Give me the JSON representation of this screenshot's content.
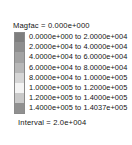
{
  "legend": {
    "header": "Magfac =  0.000e+000",
    "footer": "Interval =  2.0e+004",
    "separator": "to",
    "background_color": "#ffffff",
    "text_color": "#141414",
    "border_color": "#8a8a8a",
    "rows": [
      {
        "from": "0.0000e+000",
        "to": "2.0000e+004",
        "label": "0.0000e+000 to  2.0000e+004",
        "color": "#7e7e7e"
      },
      {
        "from": "2.0000e+004",
        "to": "4.0000e+004",
        "label": "2.0000e+004 to  4.0000e+004",
        "color": "#8e8e8e"
      },
      {
        "from": "4.0000e+004",
        "to": "6.0000e+004",
        "label": "4.0000e+004 to  6.0000e+004",
        "color": "#a3a3a3"
      },
      {
        "from": "6.0000e+004",
        "to": "8.0000e+004",
        "label": "6.0000e+004 to  8.0000e+004",
        "color": "#b8b8b8"
      },
      {
        "from": "8.0000e+004",
        "to": "1.0000e+005",
        "label": "8.0000e+004 to  1.0000e+005",
        "color": "#d6d6d6"
      },
      {
        "from": "1.0000e+005",
        "to": "1.2000e+005",
        "label": "1.0000e+005 to  1.2000e+005",
        "color": "#f4f4f4"
      },
      {
        "from": "1.2000e+005",
        "to": "1.4000e+005",
        "label": "1.2000e+005 to  1.4000e+005",
        "color": "#c9c9c9"
      },
      {
        "from": "1.4000e+005",
        "to": "1.4037e+005",
        "label": "1.4000e+005 to  1.4037e+005",
        "color": "#909090"
      }
    ]
  },
  "chart_data": {
    "type": "table",
    "title": "Magfac =  0.000e+000",
    "annotations": [
      "Interval =  2.0e+004"
    ],
    "legend_position": "left",
    "categories": [
      "0.0000e+000 to 2.0000e+004",
      "2.0000e+004 to 4.0000e+004",
      "4.0000e+004 to 6.0000e+004",
      "6.0000e+004 to 8.0000e+004",
      "8.0000e+004 to 1.0000e+005",
      "1.0000e+005 to 1.2000e+005",
      "1.2000e+005 to 1.4000e+005",
      "1.4000e+005 to 1.4037e+005"
    ],
    "bin_edges": [
      0,
      20000,
      40000,
      60000,
      80000,
      100000,
      120000,
      140000,
      140370
    ],
    "colors": [
      "#7e7e7e",
      "#8e8e8e",
      "#a3a3a3",
      "#b8b8b8",
      "#d6d6d6",
      "#f4f4f4",
      "#c9c9c9",
      "#909090"
    ],
    "interval": 20000,
    "magfac": 0.0,
    "xlabel": "",
    "ylabel": ""
  }
}
